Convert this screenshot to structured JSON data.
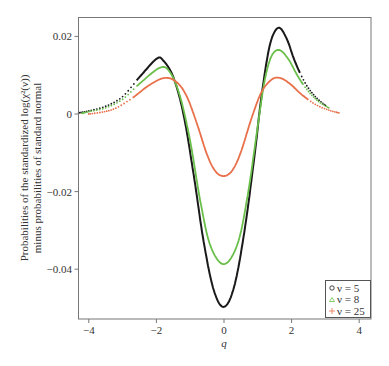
{
  "chart_data": {
    "type": "line",
    "title": "",
    "xlabel": "q",
    "ylabel_line1": "Probabilities of the standardized log(χ²(ν))",
    "ylabel_line2": "minus probabilities of standard normal",
    "xlim": [
      -4.3,
      4.3
    ],
    "ylim": [
      -0.0525,
      0.0245
    ],
    "xticks": [
      -4,
      -2,
      0,
      2,
      4
    ],
    "xtick_labels": [
      "−4",
      "−2",
      "0",
      "2",
      "4"
    ],
    "yticks": [
      0.02,
      0,
      -0.02,
      -0.04
    ],
    "ytick_labels": [
      "0.02",
      "0",
      "−0.02",
      "−0.04"
    ],
    "grid": false,
    "legend_position": "lower right",
    "series": [
      {
        "name": "ν = 5",
        "marker": "circle",
        "color": "#1a1a1a",
        "solid_range": [
          -2.6,
          2.25
        ],
        "points": [
          [
            -4.3,
            0.0003
          ],
          [
            -4.0,
            0.0008
          ],
          [
            -3.5,
            0.002
          ],
          [
            -3.0,
            0.0045
          ],
          [
            -2.5,
            0.0095
          ],
          [
            -2.0,
            0.0142
          ],
          [
            -1.8,
            0.0138
          ],
          [
            -1.5,
            0.0095
          ],
          [
            -1.2,
            0.0
          ],
          [
            -0.9,
            -0.0155
          ],
          [
            -0.6,
            -0.033
          ],
          [
            -0.3,
            -0.0455
          ],
          [
            0.0,
            -0.0497
          ],
          [
            0.3,
            -0.0445
          ],
          [
            0.6,
            -0.0305
          ],
          [
            0.9,
            -0.011
          ],
          [
            1.1,
            0.004
          ],
          [
            1.35,
            0.0175
          ],
          [
            1.6,
            0.0222
          ],
          [
            1.85,
            0.0195
          ],
          [
            2.1,
            0.0135
          ],
          [
            2.4,
            0.008
          ],
          [
            2.7,
            0.0045
          ],
          [
            3.0,
            0.0022
          ]
        ]
      },
      {
        "name": "ν = 8",
        "marker": "triangle",
        "color": "#6abf4b",
        "solid_range": [
          -2.6,
          2.35
        ],
        "points": [
          [
            -4.2,
            0.0002
          ],
          [
            -4.0,
            0.0006
          ],
          [
            -3.5,
            0.0016
          ],
          [
            -3.0,
            0.0038
          ],
          [
            -2.5,
            0.0078
          ],
          [
            -1.9,
            0.0119
          ],
          [
            -1.6,
            0.0108
          ],
          [
            -1.3,
            0.0045
          ],
          [
            -1.0,
            -0.007
          ],
          [
            -0.7,
            -0.0225
          ],
          [
            -0.4,
            -0.034
          ],
          [
            0.0,
            -0.0387
          ],
          [
            0.4,
            -0.0335
          ],
          [
            0.7,
            -0.021
          ],
          [
            1.0,
            -0.003
          ],
          [
            1.2,
            0.0085
          ],
          [
            1.4,
            0.0148
          ],
          [
            1.63,
            0.0165
          ],
          [
            1.9,
            0.0142
          ],
          [
            2.2,
            0.0095
          ],
          [
            2.5,
            0.0058
          ],
          [
            2.8,
            0.0032
          ],
          [
            3.1,
            0.0016
          ]
        ]
      },
      {
        "name": "ν = 25",
        "marker": "plus",
        "color": "#e8704a",
        "solid_range": [
          -2.7,
          2.5
        ],
        "points": [
          [
            -4.0,
            0.0
          ],
          [
            -3.6,
            0.0005
          ],
          [
            -3.2,
            0.0015
          ],
          [
            -2.7,
            0.0042
          ],
          [
            -2.2,
            0.0075
          ],
          [
            -1.75,
            0.0093
          ],
          [
            -1.4,
            0.0082
          ],
          [
            -1.1,
            0.0045
          ],
          [
            -0.8,
            -0.0025
          ],
          [
            -0.5,
            -0.0105
          ],
          [
            -0.25,
            -0.0148
          ],
          [
            0.0,
            -0.016
          ],
          [
            0.25,
            -0.0145
          ],
          [
            0.5,
            -0.0098
          ],
          [
            0.8,
            -0.0015
          ],
          [
            1.1,
            0.0055
          ],
          [
            1.4,
            0.0088
          ],
          [
            1.65,
            0.0093
          ],
          [
            1.95,
            0.0078
          ],
          [
            2.3,
            0.005
          ],
          [
            2.7,
            0.0025
          ],
          [
            3.1,
            0.001
          ],
          [
            3.4,
            0.0003
          ]
        ]
      }
    ]
  }
}
